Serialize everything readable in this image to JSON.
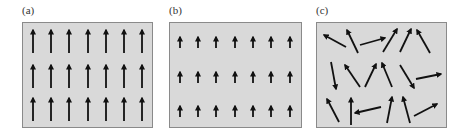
{
  "figure": {
    "colors": {
      "panel_bg": "#d9d9d9",
      "panel_border": "#8a8a8a",
      "arrow": "#111111",
      "label": "#333333"
    },
    "panels": [
      {
        "label": "(a)",
        "description": "aligned arrows, long, all pointing up",
        "box": {
          "x": 22,
          "y": 22,
          "w": 131,
          "h": 106
        },
        "arrow_style": "long-up",
        "rows": 3,
        "cols": 7
      },
      {
        "label": "(b)",
        "description": "aligned arrows, short, all pointing up",
        "box": {
          "x": 169,
          "y": 22,
          "w": 133,
          "h": 106
        },
        "arrow_style": "short-up",
        "rows": 3,
        "cols": 7
      },
      {
        "label": "(c)",
        "description": "randomly oriented arrows",
        "box": {
          "x": 316,
          "y": 22,
          "w": 131,
          "h": 106
        },
        "arrow_style": "random",
        "arrows": [
          [
            346,
            47,
            324,
            35
          ],
          [
            358,
            53,
            347,
            30
          ],
          [
            360,
            45,
            385,
            38
          ],
          [
            383,
            52,
            397,
            29
          ],
          [
            400,
            52,
            411,
            29
          ],
          [
            430,
            53,
            417,
            30
          ],
          [
            331,
            62,
            336,
            89
          ],
          [
            360,
            87,
            345,
            65
          ],
          [
            365,
            87,
            376,
            64
          ],
          [
            392,
            87,
            382,
            63
          ],
          [
            400,
            65,
            414,
            88
          ],
          [
            416,
            79,
            441,
            74
          ],
          [
            339,
            122,
            327,
            99
          ],
          [
            351,
            125,
            351,
            98
          ],
          [
            381,
            107,
            355,
            113
          ],
          [
            387,
            123,
            392,
            97
          ],
          [
            410,
            123,
            403,
            97
          ],
          [
            414,
            116,
            437,
            104
          ]
        ]
      }
    ]
  }
}
